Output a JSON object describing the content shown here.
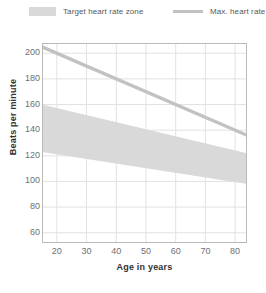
{
  "legend": {
    "items": [
      {
        "label": "Target heart rate zone",
        "marker": "band-swatch-icon",
        "color": "#d9d9d9"
      },
      {
        "label": "Max. heart rate",
        "marker": "line-swatch-icon",
        "color": "#c2c2c2"
      }
    ]
  },
  "axes": {
    "x_title": "Age in years",
    "y_title": "Beats per minute",
    "x_ticks": [
      "20",
      "30",
      "40",
      "50",
      "60",
      "70",
      "80"
    ],
    "y_ticks": [
      "200",
      "180",
      "160",
      "140",
      "120",
      "100",
      "80",
      "60"
    ]
  },
  "chart_data": {
    "type": "area",
    "title": "",
    "subtitle": "",
    "xlabel": "Age in years",
    "ylabel": "Beats per minute",
    "xlim": [
      15,
      84
    ],
    "ylim": [
      52,
      208
    ],
    "x_ticks": [
      20,
      30,
      40,
      50,
      60,
      70,
      80
    ],
    "y_ticks": [
      60,
      80,
      100,
      120,
      140,
      160,
      180,
      200
    ],
    "grid": true,
    "legend_position": "top",
    "x": [
      15,
      84
    ],
    "series": [
      {
        "name": "Max. heart rate",
        "type": "line",
        "color": "#c2c2c2",
        "values": [
          205,
          136
        ]
      },
      {
        "name": "Target heart rate zone",
        "type": "band",
        "color": "#d9d9d9",
        "upper": [
          160,
          122
        ],
        "lower": [
          123,
          98
        ]
      }
    ],
    "annotations": []
  },
  "colors": {
    "band": "#d9d9d9",
    "line": "#c2c2c2",
    "grid": "#e2e2e2",
    "axis": "#b9b9b9",
    "tick_text": "#6d7073",
    "title_text": "#2f3133",
    "legend_text": "#55585c",
    "background": "#ffffff"
  }
}
